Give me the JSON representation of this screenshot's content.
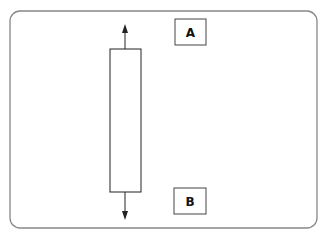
{
  "diagram": {
    "labels": {
      "top": "A",
      "bottom": "B"
    },
    "colors": {
      "stroke": "#222222",
      "frame": "#888888",
      "background": "#ffffff"
    }
  }
}
